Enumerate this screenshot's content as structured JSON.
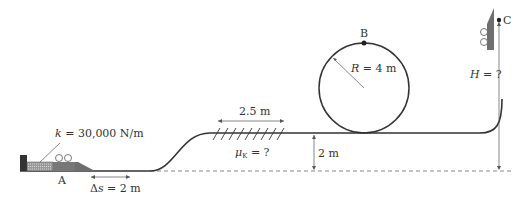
{
  "diagram": {
    "spring_label_k": "k",
    "spring_label_rest": " = 30,000 N/m",
    "point_a": "A",
    "ds_label_delta": "Δ",
    "ds_label_s": "s",
    "ds_label_rest": " = 2 m",
    "friction_length": "2.5 m",
    "mu_symbol": "μ",
    "mu_sub": "K",
    "mu_rest": " = ?",
    "height_2m": "2 m",
    "point_b": "B",
    "radius_R": "R",
    "radius_rest": " = 4 m",
    "point_c": "C",
    "height_H": "H",
    "height_H_rest": " = ?",
    "colors": {
      "line": "#333333",
      "block": "#6e6e6e",
      "dashed": "#888888"
    }
  }
}
